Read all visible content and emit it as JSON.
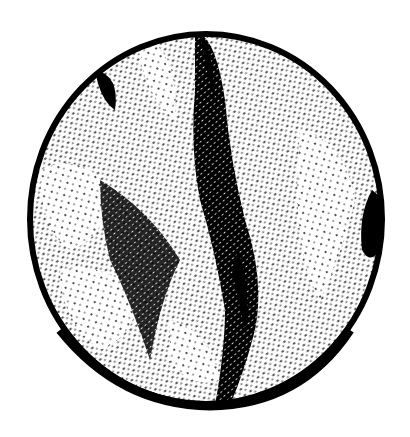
{
  "image": {
    "description": "Black-and-white stippled circular print resembling a planetary disc with a dark central vertical band and white patches",
    "colors": {
      "ink": "#000000",
      "paper": "#ffffff"
    }
  }
}
